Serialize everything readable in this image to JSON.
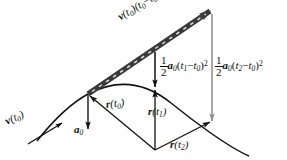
{
  "figure": {
    "name": "trajectory-vector-decomposition-diagram",
    "background_color": "#ffffff",
    "ink_color": "#111111",
    "gray_color": "#8c8c8c",
    "width": 287,
    "height": 160
  },
  "labels": {
    "tangent_displacement": {
      "name": "v(t0)(t2-t0)",
      "vector": "v",
      "vector_arg_open": "(",
      "vector_sub": "0",
      "vector_arg_close": ")",
      "term_open": "(",
      "term_t2": "t",
      "term_t2_sub": "2",
      "minus": "−",
      "term_t0": "t",
      "term_t0_sub": "0",
      "term_close": ")"
    },
    "drop_t1": {
      "name": "half a0 (t1-t0) squared",
      "numerator": "1",
      "denominator": "2",
      "accel": "a",
      "accel_sub": "0",
      "open": "(",
      "ta": "t",
      "ta_sub": "1",
      "minus": "−",
      "tb": "t",
      "tb_sub": "0",
      "close": ")",
      "power": "2"
    },
    "drop_t2": {
      "name": "half a0 (t2-t0) squared",
      "numerator": "1",
      "denominator": "2",
      "accel": "a",
      "accel_sub": "0",
      "open": "(",
      "ta": "t",
      "ta_sub": "2",
      "minus": "−",
      "tb": "t",
      "tb_sub": "0",
      "close": ")",
      "power": "2"
    },
    "velocity_initial": {
      "name": "v(t0)",
      "vector": "v",
      "open": "(",
      "t": "t",
      "t_sub": "0",
      "close": ")"
    },
    "acceleration": {
      "name": "a0",
      "vector": "a",
      "sub": "0"
    },
    "position_t0": {
      "name": "r(t0)",
      "vector": "r",
      "open": "(",
      "t": "t",
      "t_sub": "0",
      "close": ")"
    },
    "position_t1": {
      "name": "r(t1)",
      "vector": "r",
      "open": "(",
      "t": "t",
      "t_sub": "1",
      "close": ")"
    },
    "position_t2": {
      "name": "r(t2)",
      "vector": "r",
      "open": "(",
      "t": "t",
      "t_sub": "2",
      "close": ")"
    }
  }
}
